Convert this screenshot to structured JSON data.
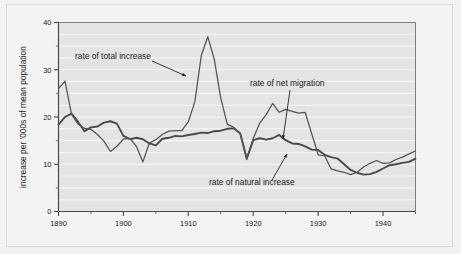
{
  "chart_data": {
    "type": "line",
    "title": "",
    "xlabel": "",
    "ylabel": "increase per '000s of mean population",
    "xlim": [
      1890,
      1945
    ],
    "ylim": [
      0,
      40
    ],
    "x_ticks": [
      1890,
      1900,
      1910,
      1920,
      1930,
      1940
    ],
    "x_tick_labels": [
      "1890",
      "1900",
      "1910",
      "1920",
      "1930",
      "1940"
    ],
    "x_minor_ticks": [
      1895,
      1905,
      1915,
      1925,
      1935,
      1945
    ],
    "y_ticks": [
      0,
      10,
      20,
      30,
      40
    ],
    "y_tick_labels": [
      "0",
      "10",
      "20",
      "30",
      "40"
    ],
    "y_minor_ticks": [
      5,
      15,
      25,
      35
    ],
    "grid": "horizontal-white-every-2.5",
    "legend_position": "inline-annotations",
    "x": [
      1890,
      1891,
      1892,
      1893,
      1894,
      1895,
      1896,
      1897,
      1898,
      1899,
      1900,
      1901,
      1902,
      1903,
      1904,
      1905,
      1906,
      1907,
      1908,
      1909,
      1910,
      1911,
      1912,
      1913,
      1914,
      1915,
      1916,
      1917,
      1918,
      1919,
      1920,
      1921,
      1922,
      1923,
      1924,
      1925,
      1926,
      1927,
      1928,
      1929,
      1930,
      1931,
      1932,
      1933,
      1934,
      1935,
      1936,
      1937,
      1938,
      1939,
      1940,
      1941,
      1942,
      1943,
      1944,
      1945
    ],
    "series": [
      {
        "name": "rate of total increase",
        "color": "#555555",
        "values": [
          26.0,
          27.6,
          20.6,
          18.5,
          17.6,
          17.4,
          16.3,
          14.9,
          12.7,
          13.8,
          15.3,
          15.5,
          13.8,
          10.5,
          14.5,
          15.2,
          16.3,
          17.0,
          17.1,
          17.1,
          19.0,
          23.2,
          33.0,
          37.0,
          32.2,
          24.0,
          18.5,
          17.8,
          16.5,
          11.0,
          15.5,
          18.7,
          20.5,
          22.9,
          21.0,
          21.6,
          21.2,
          20.8,
          21.0,
          16.5,
          12.0,
          11.8,
          9.0,
          8.6,
          8.3,
          7.8,
          8.3,
          9.4,
          10.2,
          10.8,
          10.2,
          10.3,
          11.0,
          11.5,
          12.2,
          12.8
        ]
      },
      {
        "name": "rate of natural increase",
        "color": "#4a4a4a",
        "values": [
          18.4,
          20.0,
          20.7,
          19.0,
          17.0,
          17.8,
          18.0,
          18.8,
          19.1,
          18.6,
          16.0,
          15.3,
          15.6,
          15.3,
          14.4,
          14.0,
          15.4,
          15.6,
          16.0,
          15.9,
          16.2,
          16.4,
          16.7,
          16.6,
          17.0,
          17.1,
          17.5,
          17.6,
          16.5,
          11.2,
          15.1,
          15.5,
          15.2,
          15.5,
          16.2,
          15.1,
          14.4,
          14.3,
          13.8,
          13.1,
          13.0,
          12.0,
          11.5,
          11.2,
          10.0,
          8.8,
          8.2,
          7.8,
          7.9,
          8.4,
          9.1,
          9.8,
          10.0,
          10.3,
          10.5,
          11.2
        ]
      },
      {
        "name": "rate of net migration",
        "color": "#6a6a6a",
        "values": [
          null,
          null,
          null,
          null,
          null,
          null,
          null,
          null,
          null,
          null,
          null,
          null,
          null,
          null,
          null,
          null,
          null,
          null,
          null,
          null,
          null,
          null,
          null,
          null,
          null,
          null,
          null,
          null,
          null,
          null,
          null,
          null,
          null,
          null,
          null,
          null,
          null,
          null,
          null,
          null,
          null,
          null,
          null,
          null,
          null,
          null,
          null,
          null,
          null,
          null,
          null,
          null,
          null,
          null,
          null,
          null
        ]
      }
    ],
    "annotations": [
      {
        "label": "rate of total increase",
        "label_x": 75,
        "label_y": 59,
        "arrow_from_x": 152,
        "arrow_from_y": 61,
        "arrow_to_x": 186,
        "arrow_to_y": 76
      },
      {
        "label": "rate of net migration",
        "label_x": 250,
        "label_y": 86,
        "arrow_from_x": 290,
        "arrow_from_y": 90,
        "arrow_to_x": 283,
        "arrow_to_y": 139
      },
      {
        "label": "rate of natural increase",
        "label_x": 209,
        "label_y": 185,
        "arrow_from_x": 272,
        "arrow_from_y": 180,
        "arrow_to_x": 287,
        "arrow_to_y": 154
      }
    ]
  },
  "axis": {
    "y_title": "increase per '000s of mean population"
  }
}
